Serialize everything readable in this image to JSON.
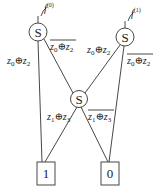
{
  "diagram": {
    "type": "decision-diagram",
    "nodes": [
      {
        "id": "s_left",
        "shape": "circle",
        "label": "S",
        "cx": 38,
        "cy": 32,
        "r": 9
      },
      {
        "id": "s_right",
        "shape": "circle",
        "label": "S",
        "cx": 125,
        "cy": 37,
        "r": 9
      },
      {
        "id": "s_mid",
        "shape": "circle",
        "label": "S",
        "cx": 79,
        "cy": 99,
        "r": 8
      },
      {
        "id": "term_1",
        "shape": "box",
        "label": "1",
        "x": 37,
        "y": 162,
        "w": 18,
        "h": 23
      },
      {
        "id": "term_0",
        "shape": "box",
        "label": "0",
        "x": 101,
        "y": 162,
        "w": 18,
        "h": 23
      }
    ],
    "roots": [
      {
        "id": "f0",
        "label": "f",
        "superscript": "(0)",
        "target": "s_left"
      },
      {
        "id": "f1",
        "label": "f",
        "superscript": "(1)",
        "target": "s_right"
      }
    ],
    "edges": [
      {
        "from": "s_left",
        "to": "term_1",
        "label": "z0⊕z2",
        "negated": false
      },
      {
        "from": "s_left",
        "to": "s_mid",
        "label": "z0⊕z2",
        "negated": true
      },
      {
        "from": "s_right",
        "to": "s_mid",
        "label": "z0⊕z2",
        "negated": false
      },
      {
        "from": "s_right",
        "to": "term_0",
        "label": "z0⊕z2",
        "negated": true
      },
      {
        "from": "s_mid",
        "to": "term_1",
        "label": "z1⊕z3",
        "negated": false
      },
      {
        "from": "s_mid",
        "to": "term_0",
        "label": "z1⊕z3",
        "negated": true
      }
    ],
    "labels": {
      "s": "S",
      "one": "1",
      "zero": "0",
      "f": "f",
      "sup0": "(0)",
      "sup1": "(1)",
      "z": "z",
      "xor": "⊕",
      "sub0": "0",
      "sub1": "1",
      "sub2": "2",
      "sub3": "3"
    }
  }
}
